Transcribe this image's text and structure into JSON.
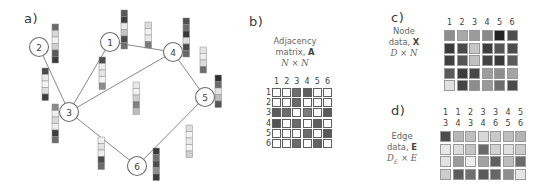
{
  "figure": {
    "panels": {
      "a": {
        "letter": "a)"
      },
      "b": {
        "letter": "b)",
        "caption_line1": "Adjacency",
        "caption_line2_pre": "matrix, ",
        "caption_line2_sym": "A",
        "caption_line3": "N × N"
      },
      "c": {
        "letter": "c)",
        "caption_line1": "Node",
        "caption_line2_pre": "data, ",
        "caption_line2_sym": "X",
        "caption_line3": "D × N"
      },
      "d": {
        "letter": "d)",
        "caption_line1": "Edge",
        "caption_line2_pre": "data, ",
        "caption_line2_sym": "E",
        "caption_line3_pre": "D",
        "caption_line3_sub": "E",
        "caption_line3_post": " × E"
      }
    }
  },
  "graph": {
    "nodes": [
      {
        "id": "2",
        "label": "2",
        "cx": 39,
        "cy": 47
      },
      {
        "id": "1",
        "label": "1",
        "cx": 110,
        "cy": 42
      },
      {
        "id": "4",
        "label": "4",
        "cx": 173,
        "cy": 52
      },
      {
        "id": "3",
        "label": "3",
        "cx": 69,
        "cy": 112
      },
      {
        "id": "5",
        "label": "5",
        "cx": 205,
        "cy": 97
      },
      {
        "id": "6",
        "label": "6",
        "cx": 137,
        "cy": 166
      }
    ],
    "node_radius": 9.5,
    "edges": [
      {
        "source": "2",
        "target": "3"
      },
      {
        "source": "1",
        "target": "3"
      },
      {
        "source": "1",
        "target": "4"
      },
      {
        "source": "3",
        "target": "4"
      },
      {
        "source": "4",
        "target": "5"
      },
      {
        "source": "3",
        "target": "6"
      },
      {
        "source": "5",
        "target": "6"
      }
    ],
    "node_strips": [
      {
        "node": "2",
        "x": 52,
        "y": 24,
        "shades": [
          "#6a6a6a",
          "#d8d8d8",
          "#f2f2f2",
          "#cfcfcf",
          "#5a5a5a",
          "#3c3c3c"
        ]
      },
      {
        "node": "1",
        "x": 121,
        "y": 10,
        "shades": [
          "#585858",
          "#3f3f3f",
          "#e8e8e8",
          "#c4c4c4",
          "#4a4a4a",
          "#6e6e6e"
        ]
      },
      {
        "node": "4",
        "x": 183,
        "y": 18,
        "shades": [
          "#4e4e4e",
          "#6c6c6c",
          "#383838",
          "#dcdcdc",
          "#4a4a4a",
          "#666666"
        ]
      },
      {
        "node": "3",
        "x": 52,
        "y": 104,
        "shades": [
          "#8a8a8a",
          "#f0f0f0",
          "#d9d9d9",
          "#ededed",
          "#3e3e3e",
          "#6b6b6b"
        ]
      },
      {
        "node": "5",
        "x": 215,
        "y": 75,
        "shades": [
          "#2f2f2f",
          "#6a6a6a",
          "#e4e4e4",
          "#bdbdbd",
          "#555555"
        ]
      },
      {
        "node": "6",
        "x": 153,
        "y": 148,
        "shades": [
          "#3a3a3a",
          "#6f6f6f",
          "#4c4c4c",
          "#8f8f8f",
          "#3d3d3d"
        ]
      }
    ],
    "edge_strips": [
      {
        "edge": "2-3",
        "x": 42,
        "y": 68,
        "shades": [
          "#4a4a4a",
          "#eaeaea",
          "#f4f4f4",
          "#dedede",
          "#3c3c3c"
        ]
      },
      {
        "edge": "1-3",
        "x": 99,
        "y": 57,
        "shades": [
          "#4f4f4f",
          "#efefef",
          "#e6e6e6",
          "#f2f2f2",
          "#8c8c8c"
        ]
      },
      {
        "edge": "1-4",
        "x": 145,
        "y": 22,
        "shades": [
          "#dcdcdc",
          "#f1f1f1",
          "#e8e8e8",
          "#7a7a7a"
        ]
      },
      {
        "edge": "3-4",
        "x": 133,
        "y": 82,
        "shades": [
          "#e9e9e9",
          "#f3f3f3",
          "#cfcfcf",
          "#7f7f7f",
          "#bdbdbd"
        ]
      },
      {
        "edge": "4-5",
        "x": 200,
        "y": 47,
        "shades": [
          "#e4e4e4",
          "#efefef",
          "#dcdcdc",
          "#6d6d6d"
        ]
      },
      {
        "edge": "3-6",
        "x": 98,
        "y": 137,
        "shades": [
          "#f0f0f0",
          "#e2e2e2",
          "#ededed",
          "#4b4b4b",
          "#6a6a6a"
        ]
      },
      {
        "edge": "5-6",
        "x": 186,
        "y": 125,
        "shades": [
          "#dddddd",
          "#f2f2f2",
          "#e8e8e8",
          "#f4f4f4",
          "#cfcfcf"
        ]
      }
    ],
    "strip_cell_w": 6.5,
    "strip_cell_h": 6.5
  },
  "chart_data": [
    {
      "id": "adjacency-matrix",
      "type": "heatmap",
      "title": "Adjacency matrix, A",
      "sublabel": "N × N",
      "col_headers": [
        "1",
        "2",
        "3",
        "4",
        "5",
        "6"
      ],
      "row_headers": [
        "1",
        "2",
        "3",
        "4",
        "5",
        "6"
      ],
      "values": [
        [
          0,
          0,
          1,
          1,
          0,
          0
        ],
        [
          0,
          0,
          1,
          0,
          0,
          0
        ],
        [
          1,
          1,
          0,
          1,
          0,
          1
        ],
        [
          1,
          0,
          1,
          0,
          1,
          0
        ],
        [
          0,
          0,
          0,
          1,
          0,
          1
        ],
        [
          0,
          0,
          1,
          0,
          1,
          0
        ]
      ],
      "shades": [
        [
          "#ffffff",
          "#ffffff",
          "#6f6f6f",
          "#5f5f5f",
          "#ffffff",
          "#ffffff"
        ],
        [
          "#ffffff",
          "#ffffff",
          "#6a6a6a",
          "#ffffff",
          "#ffffff",
          "#ffffff"
        ],
        [
          "#5d5d5d",
          "#6e6e6e",
          "#ffffff",
          "#7c7c7c",
          "#ffffff",
          "#5a5a5a"
        ],
        [
          "#535353",
          "#ffffff",
          "#6b6b6b",
          "#ffffff",
          "#5e5e5e",
          "#ffffff"
        ],
        [
          "#ffffff",
          "#ffffff",
          "#ffffff",
          "#6d6d6d",
          "#ffffff",
          "#585858"
        ],
        [
          "#ffffff",
          "#ffffff",
          "#6a6a6a",
          "#ffffff",
          "#636363",
          "#ffffff"
        ]
      ]
    },
    {
      "id": "node-data-matrix",
      "type": "heatmap",
      "title": "Node data, X",
      "sublabel": "D × N",
      "col_headers": [
        "1",
        "2",
        "3",
        "4",
        "5",
        "6"
      ],
      "row_headers": [
        "",
        "",
        "",
        "",
        ""
      ],
      "shades": [
        [
          "#8e8e8e",
          "#a8a8a8",
          "#9b9b9b",
          "#8a8a8a",
          "#232323",
          "#4e4e4e"
        ],
        [
          "#3b3b3b",
          "#4a4a4a",
          "#c6c6c6",
          "#3e3e3e",
          "#565656",
          "#4d4d4d"
        ],
        [
          "#3f3f3f",
          "#555555",
          "#c0c0c0",
          "#434343",
          "#3a3a3a",
          "#5c5c5c"
        ],
        [
          "#5a5a5a",
          "#3c3c3c",
          "#474747",
          "#9d9d9d",
          "#8e8e8e",
          "#a4a4a4"
        ],
        [
          "#e0e0e0",
          "#444444",
          "#8c8c8c",
          "#9a9a9a",
          "#6e6e6e",
          "#4a4a4a"
        ]
      ]
    },
    {
      "id": "edge-data-matrix",
      "type": "heatmap",
      "title": "Edge data, E",
      "sublabel": "D_E × E",
      "col_headers_top": [
        "1",
        "1",
        "2",
        "3",
        "3",
        "4",
        "5"
      ],
      "col_headers_bottom": [
        "3",
        "4",
        "3",
        "4",
        "6",
        "5",
        "6"
      ],
      "row_headers": [
        "",
        "",
        "",
        ""
      ],
      "shades": [
        [
          "#4d4d4d",
          "#b7b7b7",
          "#c0c0c0",
          "#d8d8d8",
          "#c9c9c9",
          "#bebebe",
          "#b4b4b4"
        ],
        [
          "#e8e8e8",
          "#dcdcdc",
          "#c4c4c4",
          "#6a6a6a",
          "#d2d2d2",
          "#e0e0e0",
          "#cbcbcb"
        ],
        [
          "#e2e2e2",
          "#9a9a9a",
          "#ededed",
          "#a2a2a2",
          "#5f5f5f",
          "#bdbdbd",
          "#6b6b6b"
        ],
        [
          "#cdcdcd",
          "#5c5c5c",
          "#707070",
          "#5a5a5a",
          "#676767",
          "#8f8f8f",
          "#e6e6e6"
        ]
      ]
    }
  ]
}
